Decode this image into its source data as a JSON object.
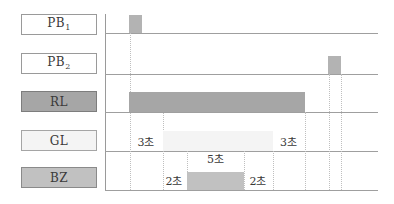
{
  "colors": {
    "background": "#ffffff",
    "line": "#9f9f9f",
    "dotted_line": "#bfbfbf",
    "text": "#3a3a3a",
    "pb_box_fill": "#ffffff",
    "rl_fill": "#a6a6a6",
    "gl_fill": "#f4f4f4",
    "bz_fill": "#c1c1c1",
    "pulse_fill": "#b3b3b3"
  },
  "rows": [
    {
      "id": "PB1",
      "label": "PB",
      "sub": "1"
    },
    {
      "id": "PB2",
      "label": "PB",
      "sub": "2"
    },
    {
      "id": "RL",
      "label": "RL",
      "sub": ""
    },
    {
      "id": "GL",
      "label": "GL",
      "sub": ""
    },
    {
      "id": "BZ",
      "label": "BZ",
      "sub": ""
    }
  ],
  "annotations": {
    "gl_on_delay": "3초",
    "bz_on_delay": "2초",
    "bz_duration": "5초",
    "gl_off_delay": "2초",
    "rl_off_delay": "3초"
  },
  "chart_data": {
    "type": "timing",
    "rows": [
      "PB1",
      "PB2",
      "RL",
      "GL",
      "BZ"
    ],
    "unit": "초 (seconds)",
    "intervals_sec": {
      "PB1_press_to_GL_on": 3,
      "GL_on_to_BZ_on": 2,
      "BZ_on_duration": 5,
      "BZ_off_to_GL_off": 2,
      "GL_off_to_RL_off": 3
    },
    "notes_visible": "PB1 short pulse at start; RL on from PB1 press until 3초 after GL off; PB2 short pulse near end"
  }
}
